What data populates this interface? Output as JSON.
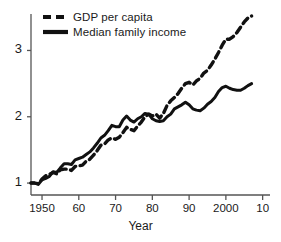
{
  "chart_data": {
    "type": "line",
    "title": "",
    "xlabel": "Year",
    "ylabel": "",
    "xlim": [
      1947,
      2012
    ],
    "ylim": [
      0.82,
      3.55
    ],
    "grid": false,
    "legend_position": "top-left",
    "xticks": [
      {
        "value": 1950,
        "label": "1950"
      },
      {
        "value": 1960,
        "label": "60"
      },
      {
        "value": 1970,
        "label": "70"
      },
      {
        "value": 1980,
        "label": "80"
      },
      {
        "value": 1990,
        "label": "90"
      },
      {
        "value": 2000,
        "label": "2000"
      },
      {
        "value": 2010,
        "label": "10"
      }
    ],
    "yticks": [
      {
        "value": 1,
        "label": "1"
      },
      {
        "value": 2,
        "label": "2"
      },
      {
        "value": 3,
        "label": "3"
      }
    ],
    "series": [
      {
        "name": "GDP per capita",
        "style": "dashed",
        "color": "#111111",
        "x": [
          1947,
          1948,
          1949,
          1950,
          1951,
          1952,
          1953,
          1954,
          1955,
          1956,
          1957,
          1958,
          1959,
          1960,
          1961,
          1962,
          1963,
          1964,
          1965,
          1966,
          1967,
          1968,
          1969,
          1970,
          1971,
          1972,
          1973,
          1974,
          1975,
          1976,
          1977,
          1978,
          1979,
          1980,
          1981,
          1982,
          1983,
          1984,
          1985,
          1986,
          1987,
          1988,
          1989,
          1990,
          1991,
          1992,
          1993,
          1994,
          1995,
          1996,
          1997,
          1998,
          1999,
          2000,
          2001,
          2002,
          2003,
          2004,
          2005,
          2006,
          2007
        ],
        "values": [
          1.0,
          1.0,
          0.99,
          1.06,
          1.11,
          1.13,
          1.16,
          1.14,
          1.2,
          1.21,
          1.21,
          1.19,
          1.25,
          1.26,
          1.27,
          1.33,
          1.36,
          1.42,
          1.49,
          1.57,
          1.59,
          1.65,
          1.68,
          1.66,
          1.69,
          1.76,
          1.84,
          1.81,
          1.79,
          1.86,
          1.92,
          2.0,
          2.04,
          2.01,
          2.04,
          1.98,
          2.05,
          2.17,
          2.24,
          2.29,
          2.35,
          2.43,
          2.5,
          2.52,
          2.48,
          2.54,
          2.58,
          2.66,
          2.7,
          2.78,
          2.87,
          2.97,
          3.08,
          3.17,
          3.17,
          3.21,
          3.27,
          3.35,
          3.43,
          3.49,
          3.52
        ]
      },
      {
        "name": "Median family income",
        "style": "solid",
        "color": "#111111",
        "x": [
          1947,
          1948,
          1949,
          1950,
          1951,
          1952,
          1953,
          1954,
          1955,
          1956,
          1957,
          1958,
          1959,
          1960,
          1961,
          1962,
          1963,
          1964,
          1965,
          1966,
          1967,
          1968,
          1969,
          1970,
          1971,
          1972,
          1973,
          1974,
          1975,
          1976,
          1977,
          1978,
          1979,
          1980,
          1981,
          1982,
          1983,
          1984,
          1985,
          1986,
          1987,
          1988,
          1989,
          1990,
          1991,
          1992,
          1993,
          1994,
          1995,
          1996,
          1997,
          1998,
          1999,
          2000,
          2001,
          2002,
          2003,
          2004,
          2005,
          2006,
          2007
        ],
        "values": [
          1.0,
          1.0,
          0.98,
          1.05,
          1.07,
          1.1,
          1.17,
          1.16,
          1.23,
          1.29,
          1.29,
          1.28,
          1.35,
          1.37,
          1.39,
          1.43,
          1.47,
          1.53,
          1.6,
          1.68,
          1.72,
          1.79,
          1.87,
          1.85,
          1.85,
          1.95,
          2.01,
          1.95,
          1.92,
          1.97,
          2.0,
          2.05,
          2.04,
          1.97,
          1.94,
          1.93,
          1.94,
          2.0,
          2.04,
          2.12,
          2.15,
          2.18,
          2.22,
          2.18,
          2.12,
          2.1,
          2.09,
          2.13,
          2.19,
          2.23,
          2.29,
          2.38,
          2.44,
          2.46,
          2.43,
          2.41,
          2.4,
          2.4,
          2.43,
          2.47,
          2.5
        ]
      }
    ]
  },
  "legend": {
    "items": [
      {
        "label": "GDP per capita",
        "style": "dashed"
      },
      {
        "label": "Median family income",
        "style": "solid"
      }
    ]
  },
  "axes": {
    "x_label": "Year"
  }
}
